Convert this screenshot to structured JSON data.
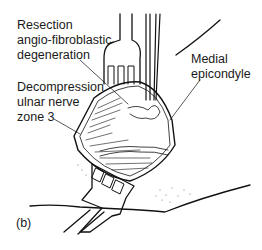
{
  "figure": {
    "panel_label": "(b)",
    "labels": {
      "resection": [
        "Resection",
        "angio-fibroblastic",
        "degeneration"
      ],
      "decompression": [
        "Decompression",
        "ulnar nerve",
        "zone 3"
      ],
      "medial": [
        "Medial",
        "epicondyle"
      ]
    },
    "colors": {
      "ink": "#111111",
      "background": "#ffffff"
    }
  }
}
